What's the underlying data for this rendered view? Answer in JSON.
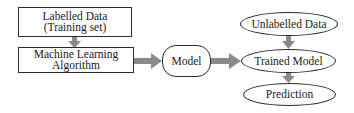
{
  "diagram": {
    "title": "",
    "colors": {
      "arrow": "#8a8a8a",
      "border": "#2a2a2a",
      "background": "#ffffff",
      "text": "#1a1a1a"
    },
    "nodes": {
      "labelled_data": {
        "shape": "rectangle",
        "lines": [
          "Labelled Data",
          "(Training set)"
        ]
      },
      "ml_algorithm": {
        "shape": "rectangle",
        "lines": [
          "Machine Learning",
          "Algorithm"
        ]
      },
      "model": {
        "shape": "rounded-rectangle",
        "lines": [
          "Model"
        ]
      },
      "unlabelled_data": {
        "shape": "ellipse",
        "lines": [
          "Unlabelled Data"
        ]
      },
      "trained_model": {
        "shape": "ellipse",
        "lines": [
          "Trained Model"
        ]
      },
      "prediction": {
        "shape": "ellipse",
        "lines": [
          "Prediction"
        ]
      }
    },
    "edges": [
      {
        "from": "labelled_data",
        "to": "ml_algorithm",
        "direction": "down"
      },
      {
        "from": "ml_algorithm",
        "to": "model",
        "direction": "right"
      },
      {
        "from": "model",
        "to": "trained_model",
        "direction": "right"
      },
      {
        "from": "unlabelled_data",
        "to": "trained_model",
        "direction": "down"
      },
      {
        "from": "trained_model",
        "to": "prediction",
        "direction": "down"
      }
    ]
  }
}
